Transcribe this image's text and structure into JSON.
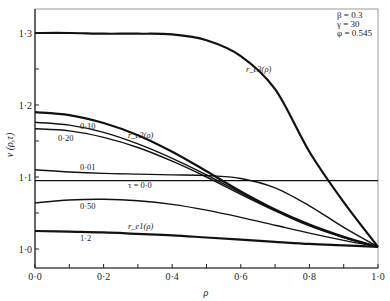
{
  "chart_data": {
    "type": "line",
    "title": "",
    "xlabel": "ρ",
    "ylabel": "v (ρ,τ)",
    "xlim": [
      0.0,
      1.0
    ],
    "ylim": [
      0.97,
      1.33
    ],
    "grid": false,
    "x_ticks": [
      "0·0",
      "0·2",
      "0·4",
      "0·6",
      "0·8",
      "1·0"
    ],
    "y_ticks": [
      "1·0",
      "1·1",
      "1·2",
      "1·3"
    ],
    "parameters": [
      "β = 0.3",
      "γ = 30",
      "φ = 0.545"
    ],
    "x": [
      0.0,
      0.1,
      0.2,
      0.3,
      0.4,
      0.5,
      0.6,
      0.7,
      0.8,
      0.9,
      1.0
    ],
    "series": [
      {
        "name": "r_e3(ρ)",
        "label": "r_e3(ρ)",
        "weight": "thick",
        "values": [
          1.3,
          1.3,
          1.299,
          1.299,
          1.298,
          1.29,
          1.268,
          1.222,
          1.135,
          1.065,
          1.003
        ]
      },
      {
        "name": "r_e2(ρ)",
        "label": "r_e2(ρ)",
        "weight": "thick",
        "values": [
          1.19,
          1.186,
          1.175,
          1.158,
          1.135,
          1.108,
          1.08,
          1.055,
          1.034,
          1.017,
          1.003
        ]
      },
      {
        "name": "τ=0.10",
        "label": "0·10",
        "weight": "normal",
        "values": [
          1.176,
          1.172,
          1.162,
          1.146,
          1.126,
          1.103,
          1.078,
          1.054,
          1.033,
          1.016,
          1.003
        ]
      },
      {
        "name": "τ=0.20",
        "label": "0·20",
        "weight": "normal",
        "values": [
          1.167,
          1.164,
          1.155,
          1.141,
          1.122,
          1.1,
          1.076,
          1.053,
          1.032,
          1.016,
          1.003
        ]
      },
      {
        "name": "τ=0.01",
        "label": "0·01",
        "weight": "normal",
        "values": [
          1.11,
          1.107,
          1.105,
          1.104,
          1.103,
          1.102,
          1.098,
          1.085,
          1.06,
          1.03,
          1.003
        ]
      },
      {
        "name": "τ=0.0",
        "label": "τ = 0·0",
        "weight": "normal",
        "values": [
          1.095,
          1.095,
          1.095,
          1.095,
          1.095,
          1.095,
          1.095,
          1.095,
          1.095,
          1.095,
          1.095
        ]
      },
      {
        "name": "τ=0.50",
        "label": "0·50",
        "weight": "normal",
        "values": [
          1.064,
          1.068,
          1.069,
          1.067,
          1.062,
          1.054,
          1.044,
          1.033,
          1.022,
          1.012,
          1.003
        ]
      },
      {
        "name": "r_e1(ρ) (τ=1.2)",
        "label": "r_e1(ρ)",
        "sub_label": "1·2",
        "weight": "thick",
        "values": [
          1.025,
          1.024,
          1.023,
          1.021,
          1.019,
          1.016,
          1.013,
          1.01,
          1.007,
          1.005,
          1.003
        ]
      }
    ]
  }
}
